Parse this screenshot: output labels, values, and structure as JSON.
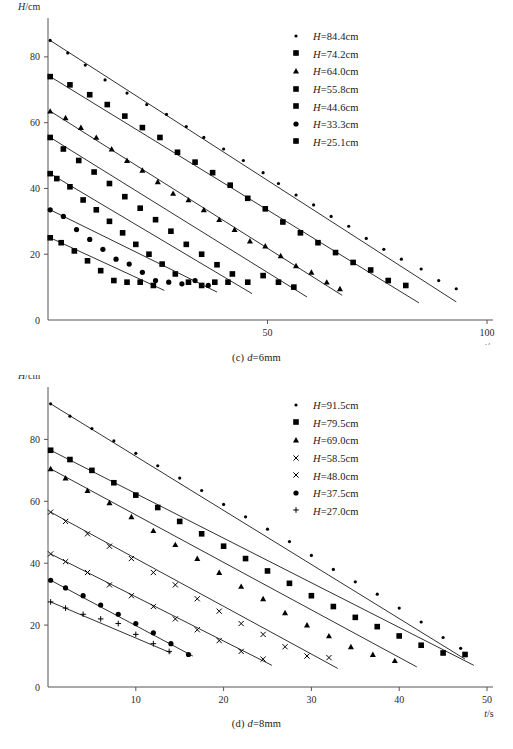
{
  "figures": [
    {
      "id": "c",
      "caption_prefix": "(c)",
      "caption_var": "d",
      "caption_value": "=6mm",
      "ylabel_var": "H",
      "ylabel_unit": "/cm",
      "xlabel_var": "t",
      "xlabel_unit": "/s",
      "legend": [
        {
          "marker": "small-dot-marker",
          "glyph": "dot",
          "label": "H=84.4cm"
        },
        {
          "marker": "square-marker",
          "glyph": "square",
          "label": "H=74.2cm"
        },
        {
          "marker": "triangle-marker",
          "glyph": "tri",
          "label": "H=64.0cm"
        },
        {
          "marker": "square-marker",
          "glyph": "square",
          "label": "H=55.8cm"
        },
        {
          "marker": "square-marker",
          "glyph": "square",
          "label": "H=44.6cm"
        },
        {
          "marker": "circle-marker",
          "glyph": "circle",
          "label": "H=33.3cm"
        },
        {
          "marker": "square-marker",
          "glyph": "square",
          "label": "H=25.1cm"
        }
      ]
    },
    {
      "id": "d",
      "caption_prefix": "(d)",
      "caption_var": "d",
      "caption_value": "=8mm",
      "ylabel_var": "H",
      "ylabel_unit": "/cm",
      "xlabel_var": "t",
      "xlabel_unit": "/s",
      "legend": [
        {
          "marker": "small-dot-marker",
          "glyph": "dot",
          "label": "H=91.5cm"
        },
        {
          "marker": "square-marker",
          "glyph": "square",
          "label": "H=79.5cm"
        },
        {
          "marker": "triangle-marker",
          "glyph": "tri",
          "label": "H=69.0cm"
        },
        {
          "marker": "cross-marker",
          "glyph": "x",
          "label": "H=58.5cm"
        },
        {
          "marker": "cross-marker",
          "glyph": "x",
          "label": "H=48.0cm"
        },
        {
          "marker": "circle-marker",
          "glyph": "circle",
          "label": "H=37.5cm"
        },
        {
          "marker": "plus-marker",
          "glyph": "plus",
          "label": "H=27.0cm"
        }
      ]
    }
  ],
  "chart_data": [
    {
      "type": "scatter",
      "id": "c",
      "title": "(c) d=6mm",
      "xlabel": "t/s",
      "ylabel": "H/cm",
      "xlim": [
        0,
        100
      ],
      "ylim": [
        0,
        90
      ],
      "xticks": [
        50,
        100
      ],
      "yticks": [
        0,
        20,
        40,
        60,
        80
      ],
      "grid": false,
      "legend_position": "upper-right",
      "series": [
        {
          "name": "H=84.4cm",
          "marker": "dot",
          "fit": {
            "x0": 0.5,
            "y0": 85.0,
            "x1": 93.0,
            "y1": 5.5
          },
          "x": [
            0.5,
            4.5,
            8.5,
            13.0,
            18.0,
            22.5,
            27.0,
            31.5,
            35.5,
            40.0,
            44.5,
            49.0,
            52.5,
            56.5,
            60.5,
            64.5,
            68.5,
            72.5,
            76.5,
            80.5,
            85.0,
            89.0,
            93.0
          ],
          "y": [
            85.0,
            81.2,
            77.5,
            73.0,
            69.0,
            65.5,
            62.5,
            58.8,
            55.5,
            52.0,
            48.5,
            44.8,
            41.5,
            38.0,
            35.0,
            31.5,
            28.5,
            24.8,
            21.5,
            18.5,
            15.5,
            12.0,
            9.5
          ]
        },
        {
          "name": "H=74.2cm",
          "marker": "square",
          "fit": {
            "x0": 0.5,
            "y0": 74.0,
            "x1": 84.5,
            "y1": 5.2
          },
          "x": [
            0.5,
            5.0,
            9.5,
            13.5,
            17.5,
            21.5,
            25.5,
            29.5,
            33.5,
            37.5,
            41.5,
            45.5,
            49.5,
            53.5,
            57.5,
            61.5,
            65.5,
            69.5,
            73.5,
            77.5,
            81.5
          ],
          "y": [
            74.0,
            71.5,
            68.5,
            65.5,
            62.0,
            58.5,
            55.5,
            51.0,
            48.0,
            44.8,
            41.0,
            37.0,
            33.8,
            29.8,
            26.5,
            23.5,
            20.5,
            17.5,
            15.2,
            12.0,
            10.5
          ]
        },
        {
          "name": "H=64.0cm",
          "marker": "tri",
          "fit": {
            "x0": 0.5,
            "y0": 63.5,
            "x1": 67.0,
            "y1": 7.5
          },
          "x": [
            0.5,
            4.0,
            7.5,
            11.0,
            14.5,
            18.0,
            21.5,
            25.0,
            28.5,
            32.0,
            35.5,
            39.0,
            42.5,
            46.0,
            49.5,
            53.0,
            56.5,
            60.0,
            63.5,
            66.5
          ],
          "y": [
            63.5,
            61.5,
            58.5,
            55.5,
            52.0,
            48.5,
            45.5,
            42.0,
            38.5,
            36.5,
            33.5,
            30.5,
            27.5,
            24.0,
            22.5,
            19.5,
            16.5,
            14.5,
            11.5,
            9.5
          ]
        },
        {
          "name": "H=55.8cm",
          "marker": "square",
          "fit": {
            "x0": 0.5,
            "y0": 55.5,
            "x1": 59.0,
            "y1": 7.0
          },
          "x": [
            0.5,
            3.5,
            7.0,
            10.5,
            14.0,
            17.5,
            21.0,
            24.5,
            28.0,
            31.5,
            35.0,
            38.5,
            42.0,
            45.5,
            49.0,
            52.5,
            56.0
          ],
          "y": [
            55.5,
            52.0,
            48.5,
            45.0,
            41.5,
            37.5,
            34.0,
            30.5,
            27.0,
            23.0,
            20.0,
            16.8,
            14.0,
            11.5,
            13.5,
            11.5,
            10.0
          ]
        },
        {
          "name": "H=44.6cm",
          "marker": "square",
          "fit": {
            "x0": 0.5,
            "y0": 44.5,
            "x1": 46.5,
            "y1": 8.0
          },
          "x": [
            0.5,
            2.0,
            5.0,
            8.0,
            11.0,
            14.0,
            17.0,
            20.0,
            23.0,
            26.0,
            29.0,
            32.0,
            35.0,
            38.0,
            41.0
          ],
          "y": [
            44.5,
            43.0,
            40.5,
            36.5,
            33.5,
            30.0,
            26.5,
            23.0,
            20.0,
            17.0,
            14.0,
            11.5,
            10.5,
            11.5,
            11.5
          ]
        },
        {
          "name": "H=33.3cm",
          "marker": "circle",
          "fit": {
            "x0": 0.5,
            "y0": 33.5,
            "x1": 38.5,
            "y1": 8.5
          },
          "x": [
            0.5,
            3.5,
            6.5,
            9.5,
            12.5,
            15.5,
            18.5,
            21.5,
            24.5,
            27.5,
            30.5,
            33.5,
            36.5
          ],
          "y": [
            33.5,
            31.5,
            27.5,
            24.5,
            21.5,
            18.5,
            17.0,
            14.5,
            12.0,
            11.5,
            11.0,
            12.0,
            10.5
          ]
        },
        {
          "name": "H=25.1cm",
          "marker": "square",
          "fit": {
            "x0": 0.5,
            "y0": 25.0,
            "x1": 26.5,
            "y1": 9.0
          },
          "x": [
            0.5,
            3.0,
            6.0,
            9.0,
            12.0,
            15.0,
            18.0,
            21.0,
            24.0
          ],
          "y": [
            25.0,
            23.5,
            21.0,
            18.0,
            15.0,
            12.0,
            11.5,
            11.5,
            10.5
          ]
        }
      ]
    },
    {
      "type": "scatter",
      "id": "d",
      "title": "(d) d=8mm",
      "xlabel": "t/s",
      "ylabel": "H/cm",
      "xlim": [
        0,
        50
      ],
      "ylim": [
        0,
        95
      ],
      "xticks": [
        10,
        20,
        30,
        40,
        50
      ],
      "yticks": [
        0,
        20,
        40,
        60,
        80
      ],
      "grid": false,
      "legend_position": "upper-right",
      "series": [
        {
          "name": "H=91.5cm",
          "marker": "dot",
          "fit": {
            "x0": 0.3,
            "y0": 91.5,
            "x1": 47.5,
            "y1": 9.0
          },
          "x": [
            0.3,
            2.5,
            5.0,
            7.5,
            10.0,
            12.5,
            15.0,
            17.5,
            20.0,
            22.5,
            25.0,
            27.5,
            30.0,
            32.5,
            35.0,
            37.5,
            40.0,
            42.5,
            45.0,
            47.0
          ],
          "y": [
            91.5,
            87.5,
            83.5,
            79.5,
            75.5,
            71.5,
            67.5,
            63.5,
            59.0,
            55.0,
            51.0,
            47.0,
            42.5,
            38.0,
            34.0,
            30.0,
            25.5,
            21.0,
            16.0,
            12.5
          ]
        },
        {
          "name": "H=79.5cm",
          "marker": "square",
          "fit": {
            "x0": 0.3,
            "y0": 76.5,
            "x1": 48.5,
            "y1": 7.0
          },
          "x": [
            0.3,
            2.5,
            5.0,
            7.5,
            10.0,
            12.5,
            15.0,
            17.5,
            20.0,
            22.5,
            25.0,
            27.5,
            30.0,
            32.5,
            35.0,
            37.5,
            40.0,
            42.5,
            45.0,
            47.5
          ],
          "y": [
            76.5,
            73.5,
            70.0,
            66.0,
            62.0,
            58.0,
            53.5,
            49.5,
            45.5,
            41.5,
            37.5,
            33.5,
            29.5,
            26.0,
            22.5,
            19.5,
            16.5,
            13.5,
            11.0,
            10.5
          ]
        },
        {
          "name": "H=69.0cm",
          "marker": "tri",
          "fit": {
            "x0": 0.3,
            "y0": 70.5,
            "x1": 42.0,
            "y1": 6.5
          },
          "x": [
            0.3,
            2.0,
            4.5,
            7.0,
            9.5,
            12.0,
            14.5,
            17.0,
            19.5,
            22.0,
            24.5,
            27.0,
            29.5,
            32.0,
            34.5,
            37.0,
            39.5
          ],
          "y": [
            70.5,
            67.5,
            63.5,
            59.5,
            55.0,
            50.5,
            46.0,
            41.5,
            37.0,
            32.5,
            28.5,
            24.0,
            20.0,
            16.5,
            13.0,
            10.5,
            8.5
          ]
        },
        {
          "name": "H=58.5cm",
          "marker": "x",
          "fit": {
            "x0": 0.3,
            "y0": 56.5,
            "x1": 33.0,
            "y1": 6.0
          },
          "x": [
            0.3,
            2.0,
            4.5,
            7.0,
            9.5,
            12.0,
            14.5,
            17.0,
            19.5,
            22.0,
            24.5,
            27.0,
            29.5,
            32.0
          ],
          "y": [
            56.5,
            53.5,
            49.5,
            45.5,
            41.5,
            37.0,
            33.0,
            28.5,
            24.5,
            20.5,
            17.0,
            13.0,
            10.0,
            9.5
          ]
        },
        {
          "name": "H=48.0cm",
          "marker": "x",
          "fit": {
            "x0": 0.3,
            "y0": 43.0,
            "x1": 25.5,
            "y1": 7.0
          },
          "x": [
            0.3,
            2.0,
            4.5,
            7.0,
            9.5,
            12.0,
            14.5,
            17.0,
            19.5,
            22.0,
            24.5
          ],
          "y": [
            43.0,
            40.5,
            37.0,
            33.0,
            29.5,
            26.0,
            22.0,
            18.5,
            15.0,
            11.5,
            9.0
          ]
        },
        {
          "name": "H=37.5cm",
          "marker": "circle",
          "fit": {
            "x0": 0.3,
            "y0": 34.5,
            "x1": 16.5,
            "y1": 10.0
          },
          "x": [
            0.3,
            2.0,
            4.0,
            6.0,
            8.0,
            10.0,
            12.0,
            14.0,
            16.0
          ],
          "y": [
            34.5,
            32.0,
            29.5,
            26.5,
            23.5,
            20.5,
            17.5,
            14.0,
            10.5
          ]
        },
        {
          "name": "H=27.0cm",
          "marker": "plus",
          "fit": {
            "x0": 0.3,
            "y0": 27.5,
            "x1": 14.0,
            "y1": 11.0
          },
          "x": [
            0.3,
            2.0,
            4.0,
            6.0,
            8.0,
            10.0,
            12.0,
            13.8
          ],
          "y": [
            27.5,
            25.5,
            23.5,
            22.0,
            20.5,
            17.0,
            14.0,
            11.5
          ]
        }
      ]
    }
  ]
}
